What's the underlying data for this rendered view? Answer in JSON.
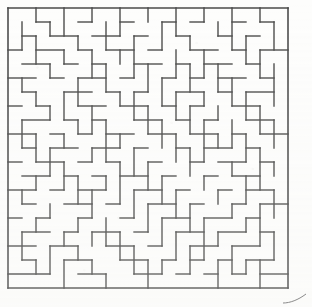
{
  "document": {
    "type": "maze-puzzle",
    "title": "Maze",
    "background_color": "#fdfdfc",
    "wall_color": "#4a4a4a",
    "page_width": 312,
    "page_height": 307
  },
  "maze": {
    "name": "rectangular-grid-maze",
    "cols": 20,
    "rows": 20,
    "cell_size": 14,
    "origin_x": 8,
    "origin_y": 8,
    "wall_thickness": 1.4,
    "border_thickness": 1.6,
    "border": {
      "top": true,
      "right": true,
      "bottom": true,
      "left": true
    },
    "horizontal_walls": [
      [
        0,
        0,
        20
      ],
      [
        1,
        2,
        3
      ],
      [
        1,
        5,
        6
      ],
      [
        1,
        8,
        9
      ],
      [
        1,
        11,
        12
      ],
      [
        1,
        13,
        14
      ],
      [
        1,
        16,
        17
      ],
      [
        1,
        18,
        19
      ],
      [
        2,
        1,
        2
      ],
      [
        2,
        3,
        5
      ],
      [
        2,
        6,
        8
      ],
      [
        2,
        9,
        10
      ],
      [
        2,
        12,
        13
      ],
      [
        2,
        15,
        16
      ],
      [
        2,
        17,
        18
      ],
      [
        3,
        0,
        1
      ],
      [
        3,
        2,
        4
      ],
      [
        3,
        5,
        6
      ],
      [
        3,
        7,
        9
      ],
      [
        3,
        10,
        11
      ],
      [
        3,
        13,
        15
      ],
      [
        3,
        16,
        17
      ],
      [
        3,
        18,
        20
      ],
      [
        4,
        1,
        3
      ],
      [
        4,
        4,
        5
      ],
      [
        4,
        6,
        7
      ],
      [
        4,
        9,
        11
      ],
      [
        4,
        12,
        13
      ],
      [
        4,
        14,
        16
      ],
      [
        4,
        17,
        18
      ],
      [
        5,
        0,
        2
      ],
      [
        5,
        3,
        4
      ],
      [
        5,
        5,
        7
      ],
      [
        5,
        8,
        9
      ],
      [
        5,
        11,
        12
      ],
      [
        5,
        13,
        14
      ],
      [
        5,
        15,
        17
      ],
      [
        5,
        18,
        19
      ],
      [
        6,
        1,
        2
      ],
      [
        6,
        4,
        6
      ],
      [
        6,
        7,
        8
      ],
      [
        6,
        9,
        10
      ],
      [
        6,
        12,
        14
      ],
      [
        6,
        15,
        16
      ],
      [
        6,
        17,
        19
      ],
      [
        7,
        0,
        1
      ],
      [
        7,
        2,
        3
      ],
      [
        7,
        5,
        7
      ],
      [
        7,
        8,
        10
      ],
      [
        7,
        11,
        12
      ],
      [
        7,
        13,
        14
      ],
      [
        7,
        16,
        18
      ],
      [
        8,
        1,
        3
      ],
      [
        8,
        4,
        5
      ],
      [
        8,
        6,
        7
      ],
      [
        8,
        9,
        11
      ],
      [
        8,
        12,
        13
      ],
      [
        8,
        14,
        15
      ],
      [
        8,
        17,
        19
      ],
      [
        9,
        0,
        2
      ],
      [
        9,
        3,
        4
      ],
      [
        9,
        5,
        6
      ],
      [
        9,
        7,
        9
      ],
      [
        9,
        10,
        12
      ],
      [
        9,
        13,
        15
      ],
      [
        9,
        16,
        17
      ],
      [
        9,
        18,
        20
      ],
      [
        10,
        1,
        2
      ],
      [
        10,
        3,
        5
      ],
      [
        10,
        6,
        8
      ],
      [
        10,
        9,
        10
      ],
      [
        10,
        12,
        13
      ],
      [
        10,
        14,
        16
      ],
      [
        10,
        17,
        18
      ],
      [
        11,
        0,
        1
      ],
      [
        11,
        2,
        4
      ],
      [
        11,
        5,
        6
      ],
      [
        11,
        7,
        8
      ],
      [
        11,
        10,
        11
      ],
      [
        11,
        13,
        14
      ],
      [
        11,
        15,
        17
      ],
      [
        11,
        18,
        19
      ],
      [
        12,
        1,
        3
      ],
      [
        12,
        4,
        5
      ],
      [
        12,
        6,
        7
      ],
      [
        12,
        8,
        10
      ],
      [
        12,
        11,
        12
      ],
      [
        12,
        14,
        15
      ],
      [
        12,
        16,
        18
      ],
      [
        13,
        0,
        2
      ],
      [
        13,
        3,
        4
      ],
      [
        13,
        5,
        7
      ],
      [
        13,
        9,
        11
      ],
      [
        13,
        12,
        13
      ],
      [
        13,
        15,
        16
      ],
      [
        13,
        17,
        19
      ],
      [
        14,
        1,
        2
      ],
      [
        14,
        4,
        6
      ],
      [
        14,
        7,
        8
      ],
      [
        14,
        10,
        12
      ],
      [
        14,
        13,
        14
      ],
      [
        14,
        16,
        17
      ],
      [
        14,
        18,
        20
      ],
      [
        15,
        0,
        1
      ],
      [
        15,
        2,
        3
      ],
      [
        15,
        5,
        6
      ],
      [
        15,
        8,
        9
      ],
      [
        15,
        11,
        13
      ],
      [
        15,
        14,
        16
      ],
      [
        15,
        17,
        18
      ],
      [
        16,
        1,
        3
      ],
      [
        16,
        4,
        5
      ],
      [
        16,
        6,
        8
      ],
      [
        16,
        9,
        10
      ],
      [
        16,
        12,
        14
      ],
      [
        16,
        15,
        17
      ],
      [
        16,
        18,
        19
      ],
      [
        17,
        0,
        2
      ],
      [
        17,
        3,
        5
      ],
      [
        17,
        7,
        9
      ],
      [
        17,
        10,
        11
      ],
      [
        17,
        13,
        15
      ],
      [
        17,
        16,
        18
      ],
      [
        18,
        1,
        2
      ],
      [
        18,
        4,
        6
      ],
      [
        18,
        8,
        10
      ],
      [
        18,
        11,
        12
      ],
      [
        18,
        13,
        14
      ],
      [
        18,
        15,
        16
      ],
      [
        18,
        17,
        19
      ],
      [
        19,
        0,
        3
      ],
      [
        19,
        5,
        7
      ],
      [
        19,
        9,
        11
      ],
      [
        19,
        12,
        13
      ],
      [
        19,
        14,
        15
      ],
      [
        19,
        16,
        17
      ],
      [
        19,
        18,
        20
      ],
      [
        20,
        0,
        20
      ]
    ],
    "vertical_walls": [
      [
        0,
        0,
        20
      ],
      [
        1,
        1,
        3
      ],
      [
        1,
        5,
        6
      ],
      [
        1,
        8,
        10
      ],
      [
        1,
        13,
        14
      ],
      [
        1,
        16,
        18
      ],
      [
        2,
        0,
        1
      ],
      [
        2,
        2,
        4
      ],
      [
        2,
        6,
        7
      ],
      [
        2,
        9,
        11
      ],
      [
        2,
        12,
        13
      ],
      [
        2,
        15,
        16
      ],
      [
        2,
        18,
        19
      ],
      [
        3,
        1,
        2
      ],
      [
        3,
        4,
        5
      ],
      [
        3,
        7,
        8
      ],
      [
        3,
        10,
        12
      ],
      [
        3,
        14,
        15
      ],
      [
        3,
        17,
        19
      ],
      [
        4,
        0,
        2
      ],
      [
        4,
        3,
        4
      ],
      [
        4,
        6,
        8
      ],
      [
        4,
        9,
        10
      ],
      [
        4,
        11,
        13
      ],
      [
        4,
        16,
        17
      ],
      [
        4,
        18,
        20
      ],
      [
        5,
        2,
        3
      ],
      [
        5,
        5,
        7
      ],
      [
        5,
        8,
        9
      ],
      [
        5,
        12,
        14
      ],
      [
        5,
        15,
        16
      ],
      [
        5,
        17,
        18
      ],
      [
        6,
        0,
        1
      ],
      [
        6,
        3,
        5
      ],
      [
        6,
        7,
        9
      ],
      [
        6,
        10,
        11
      ],
      [
        6,
        13,
        15
      ],
      [
        6,
        16,
        17
      ],
      [
        6,
        18,
        19
      ],
      [
        7,
        1,
        3
      ],
      [
        7,
        4,
        6
      ],
      [
        7,
        8,
        11
      ],
      [
        7,
        12,
        13
      ],
      [
        7,
        15,
        17
      ],
      [
        7,
        19,
        20
      ],
      [
        8,
        0,
        2
      ],
      [
        8,
        3,
        4
      ],
      [
        8,
        6,
        7
      ],
      [
        8,
        9,
        10
      ],
      [
        8,
        11,
        14
      ],
      [
        8,
        16,
        18
      ],
      [
        9,
        2,
        5
      ],
      [
        9,
        6,
        8
      ],
      [
        9,
        10,
        12
      ],
      [
        9,
        13,
        15
      ],
      [
        9,
        17,
        19
      ],
      [
        10,
        0,
        1
      ],
      [
        10,
        4,
        6
      ],
      [
        10,
        7,
        9
      ],
      [
        10,
        11,
        13
      ],
      [
        10,
        14,
        16
      ],
      [
        10,
        18,
        20
      ],
      [
        11,
        1,
        3
      ],
      [
        11,
        5,
        7
      ],
      [
        11,
        8,
        10
      ],
      [
        11,
        12,
        14
      ],
      [
        11,
        15,
        17
      ],
      [
        11,
        18,
        19
      ],
      [
        12,
        0,
        2
      ],
      [
        12,
        3,
        5
      ],
      [
        12,
        6,
        8
      ],
      [
        12,
        9,
        11
      ],
      [
        12,
        13,
        15
      ],
      [
        12,
        16,
        18
      ],
      [
        13,
        2,
        3
      ],
      [
        13,
        4,
        6
      ],
      [
        13,
        7,
        9
      ],
      [
        13,
        10,
        12
      ],
      [
        13,
        14,
        16
      ],
      [
        13,
        17,
        19
      ],
      [
        14,
        0,
        1
      ],
      [
        14,
        3,
        5
      ],
      [
        14,
        6,
        7
      ],
      [
        14,
        8,
        11
      ],
      [
        14,
        12,
        13
      ],
      [
        14,
        15,
        18
      ],
      [
        15,
        1,
        2
      ],
      [
        15,
        4,
        6
      ],
      [
        15,
        7,
        8
      ],
      [
        15,
        9,
        10
      ],
      [
        15,
        13,
        14
      ],
      [
        15,
        16,
        17
      ],
      [
        15,
        18,
        20
      ],
      [
        16,
        0,
        3
      ],
      [
        16,
        5,
        7
      ],
      [
        16,
        8,
        10
      ],
      [
        16,
        11,
        12
      ],
      [
        16,
        14,
        15
      ],
      [
        16,
        17,
        19
      ],
      [
        17,
        2,
        4
      ],
      [
        17,
        6,
        8
      ],
      [
        17,
        9,
        11
      ],
      [
        17,
        12,
        14
      ],
      [
        17,
        15,
        16
      ],
      [
        17,
        18,
        19
      ],
      [
        18,
        0,
        1
      ],
      [
        18,
        3,
        5
      ],
      [
        18,
        7,
        9
      ],
      [
        18,
        10,
        13
      ],
      [
        18,
        14,
        17
      ],
      [
        18,
        18,
        20
      ],
      [
        19,
        1,
        3
      ],
      [
        19,
        4,
        7
      ],
      [
        19,
        8,
        10
      ],
      [
        19,
        11,
        12
      ],
      [
        19,
        13,
        15
      ],
      [
        19,
        16,
        18
      ],
      [
        20,
        0,
        20
      ]
    ]
  },
  "corner_mark": {
    "name": "page-corner-curl",
    "visible": true
  }
}
